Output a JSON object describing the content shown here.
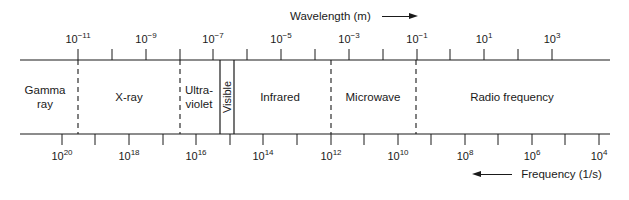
{
  "wavelength_axis": {
    "title": "Wavelength (m)",
    "arrow": "right-arrow",
    "ticks_x": [
      78,
      112,
      146,
      180,
      213,
      247,
      281,
      315,
      349,
      383,
      417,
      450,
      484,
      518,
      552
    ],
    "labels": [
      {
        "x": 78,
        "base": "10",
        "exp": "−11"
      },
      {
        "x": 146,
        "base": "10",
        "exp": "−9"
      },
      {
        "x": 213,
        "base": "10",
        "exp": "−7"
      },
      {
        "x": 281,
        "base": "10",
        "exp": "−5"
      },
      {
        "x": 349,
        "base": "10",
        "exp": "−3"
      },
      {
        "x": 417,
        "base": "10",
        "exp": "−1"
      },
      {
        "x": 484,
        "base": "10",
        "exp": "1"
      },
      {
        "x": 552,
        "base": "10",
        "exp": "3"
      }
    ]
  },
  "frequency_axis": {
    "title": "Frequency (1/s)",
    "arrow": "left-arrow",
    "ticks_x": [
      62,
      95,
      129,
      163,
      196,
      230,
      263,
      297,
      331,
      364,
      398,
      431,
      465,
      498,
      532,
      565,
      599
    ],
    "labels": [
      {
        "x": 62,
        "base": "10",
        "exp": "20"
      },
      {
        "x": 129,
        "base": "10",
        "exp": "18"
      },
      {
        "x": 196,
        "base": "10",
        "exp": "16"
      },
      {
        "x": 263,
        "base": "10",
        "exp": "14"
      },
      {
        "x": 331,
        "base": "10",
        "exp": "12"
      },
      {
        "x": 398,
        "base": "10",
        "exp": "10"
      },
      {
        "x": 465,
        "base": "10",
        "exp": "8"
      },
      {
        "x": 532,
        "base": "10",
        "exp": "6"
      },
      {
        "x": 599,
        "base": "10",
        "exp": "4"
      }
    ]
  },
  "regions": [
    {
      "name": "gamma-ray",
      "line1": "Gamma",
      "line2": "ray",
      "x": 45
    },
    {
      "name": "x-ray",
      "line1": "X-ray",
      "line2": "",
      "x": 129
    },
    {
      "name": "ultraviolet",
      "line1": "Ultra-",
      "line2": "violet",
      "x": 199
    },
    {
      "name": "infrared",
      "line1": "Infrared",
      "line2": "",
      "x": 280
    },
    {
      "name": "microwave",
      "line1": "Microwave",
      "line2": "",
      "x": 373
    },
    {
      "name": "radio-frequency",
      "line1": "Radio frequency",
      "line2": "",
      "x": 512
    }
  ],
  "visible": {
    "label": "Visible",
    "x1": 220,
    "x2": 234
  },
  "dashed_boundaries_x": [
    78,
    180,
    331,
    416
  ]
}
